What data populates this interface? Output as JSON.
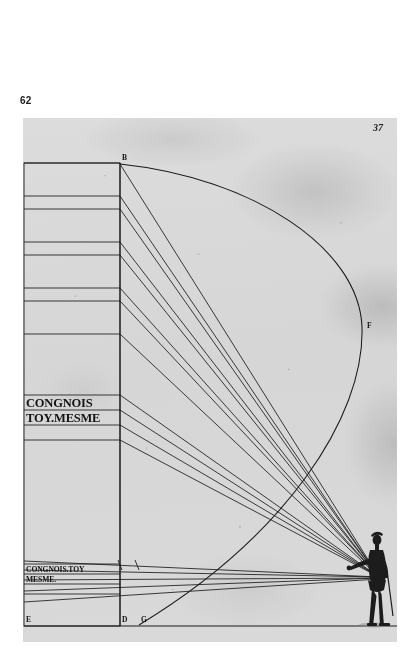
{
  "book": {
    "modern_page_number": "62"
  },
  "plate": {
    "old_folio_number": "37",
    "paper_color": "#ececec",
    "ink_color": "#141414",
    "motto_large_lines": [
      "CONG",
      "NOIS",
      "TOY",
      "MESME"
    ],
    "motto_medium_lines": [
      "CONGNOIS",
      "TOY.MESME"
    ],
    "motto_small_lines": [
      "CONGNOIS.TOY",
      "MESME."
    ],
    "point_labels": [
      {
        "id": "B",
        "x": 109,
        "y": 163,
        "desc": "top of picture plane"
      },
      {
        "id": "F",
        "x": 345,
        "y": 327,
        "desc": "arc apex right"
      },
      {
        "id": "E",
        "x": 22,
        "y": 632,
        "desc": "bottom left of column"
      },
      {
        "id": "D",
        "x": 120,
        "y": 632,
        "desc": "foot of vertical line"
      },
      {
        "id": "G",
        "x": 139,
        "y": 632,
        "desc": "foot of arc"
      }
    ],
    "figure": {
      "name": "standing observer",
      "eye_point_x": 378,
      "eye_point_y": 578
    },
    "ray_count_upper": 10,
    "ray_count_lower": 4,
    "geometry_note": "perspective projection rays converge at observer"
  }
}
